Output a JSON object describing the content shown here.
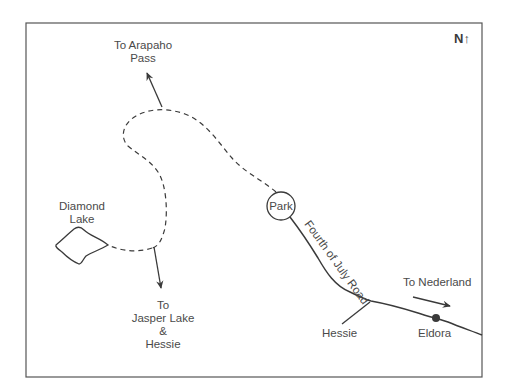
{
  "map": {
    "compass": "N↑",
    "labels": {
      "arapaho_line1": "To Arapaho",
      "arapaho_line2": "Pass",
      "diamond_line1": "Diamond",
      "diamond_line2": "Lake",
      "jasper_line1": "To",
      "jasper_line2": "Jasper Lake",
      "jasper_line3": "&",
      "jasper_line4": "Hessie",
      "park": "Park",
      "road": "Fourth of July Road",
      "nederland": "To Nederland",
      "hessie": "Hessie",
      "eldora": "Eldora"
    },
    "colors": {
      "line": "#3a3a3a",
      "text": "#4a4a4a",
      "background": "#ffffff"
    }
  }
}
